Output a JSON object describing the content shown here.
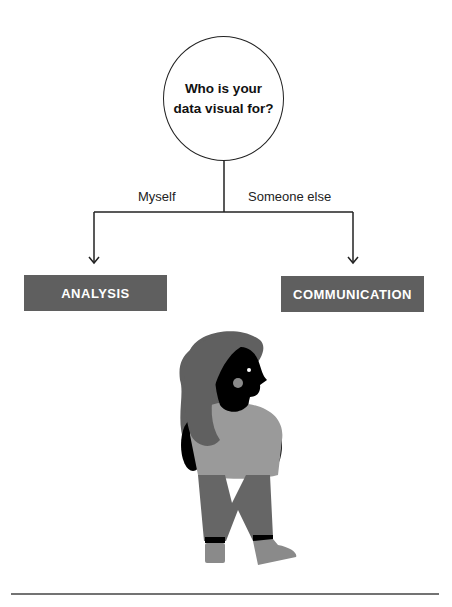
{
  "question": {
    "line1": "Who is your",
    "line2": "data visual for?"
  },
  "branches": {
    "left": {
      "label": "Myself",
      "target": "ANALYSIS"
    },
    "right": {
      "label": "Someone else",
      "target": "COMMUNICATION"
    }
  },
  "colors": {
    "box_fill": "#5f5f5f",
    "line": "#222222",
    "hair": "#606060",
    "skin": "#000000",
    "shirt": "#9a9a9a",
    "pants": "#666666",
    "shoes": "#8a8a8a"
  }
}
